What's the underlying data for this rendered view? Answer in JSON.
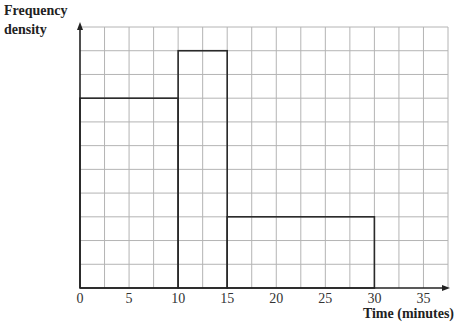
{
  "chart_data": {
    "type": "histogram",
    "title": "",
    "xlabel": "Time (minutes)",
    "ylabel": "Frequency density",
    "x_ticks": [
      0,
      5,
      10,
      15,
      20,
      25,
      30,
      35
    ],
    "x_tick_labels": [
      "0",
      "5",
      "10",
      "15",
      "20",
      "25",
      "30",
      "35"
    ],
    "xlim": [
      0,
      37.5
    ],
    "ylim": [
      0,
      11
    ],
    "y_tick_labels": [],
    "grid": true,
    "grid_x_step": 2.5,
    "grid_y_step": 1,
    "bins": [
      {
        "from": 0,
        "to": 10,
        "height": 8
      },
      {
        "from": 10,
        "to": 15,
        "height": 10
      },
      {
        "from": 15,
        "to": 30,
        "height": 3
      }
    ],
    "note": "Y-axis has no numeric scale; heights given in grid units"
  },
  "labels": {
    "ylabel_line1": "Frequency",
    "ylabel_line2": "density",
    "xlabel": "Time (minutes)"
  },
  "colors": {
    "grid": "#b4b4b4",
    "bars": "#2a2a2a",
    "axis": "#222222"
  }
}
